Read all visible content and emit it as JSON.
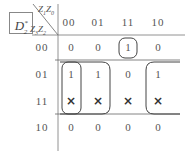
{
  "map": {
    "function_label": "D",
    "function_sub": "2",
    "function_sup": "*",
    "col_vars": "Z1Z0",
    "row_vars": "Z3Z2",
    "col_var_parts": {
      "a": "Z",
      "a_sub": "1",
      "b": "Z",
      "b_sub": "0"
    },
    "row_var_parts": {
      "a": "Z",
      "a_sub": "3",
      "b": "Z",
      "b_sub": "2"
    },
    "col_headers": [
      "00",
      "01",
      "11",
      "10"
    ],
    "row_headers": [
      "00",
      "01",
      "11",
      "10"
    ],
    "cells": [
      [
        "0",
        "0",
        "1",
        "0"
      ],
      [
        "1",
        "1",
        "0",
        "1"
      ],
      [
        "×",
        "×",
        "×",
        "×"
      ],
      [
        "0",
        "0",
        "0",
        "0"
      ]
    ],
    "groupings": [
      {
        "cells": "row00-col11",
        "shape": "rounded-rect"
      },
      {
        "cells": "rows01-11-col00",
        "shape": "rounded-rect"
      },
      {
        "cells": "rows01-11-cols00-01",
        "shape": "rounded-open-right"
      },
      {
        "cells": "rows01-11-col10",
        "shape": "rounded-open-left"
      }
    ]
  }
}
